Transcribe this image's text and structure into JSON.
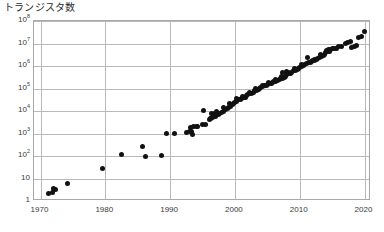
{
  "chart_data": {
    "type": "scatter",
    "title": "トランジスタ数",
    "xlabel": "",
    "ylabel": "",
    "xlim": [
      1969,
      2021
    ],
    "ylim_log10": [
      0,
      8
    ],
    "yscale": "log",
    "grid": true,
    "legend": "none",
    "marker": {
      "shape": "circle",
      "color": "#111111",
      "size_px": 5
    },
    "y_ticks": [
      {
        "value": 1,
        "label": "1",
        "mantissa": "1",
        "exponent": ""
      },
      {
        "value": 10,
        "label": "10",
        "mantissa": "10",
        "exponent": ""
      },
      {
        "value": 100,
        "label": "10^2",
        "mantissa": "10",
        "exponent": "2"
      },
      {
        "value": 1000,
        "label": "10^3",
        "mantissa": "10",
        "exponent": "3"
      },
      {
        "value": 10000,
        "label": "10^4",
        "mantissa": "10",
        "exponent": "4"
      },
      {
        "value": 100000,
        "label": "10^5",
        "mantissa": "10",
        "exponent": "5"
      },
      {
        "value": 1000000,
        "label": "10^6",
        "mantissa": "10",
        "exponent": "6"
      },
      {
        "value": 10000000,
        "label": "10^7",
        "mantissa": "10",
        "exponent": "7"
      },
      {
        "value": 100000000,
        "label": "10^8",
        "mantissa": "10",
        "exponent": "8"
      }
    ],
    "x_ticks": [
      {
        "value": 1970,
        "label": "1970"
      },
      {
        "value": 1980,
        "label": "1980"
      },
      {
        "value": 1990,
        "label": "1990"
      },
      {
        "value": 2000,
        "label": "2000"
      },
      {
        "value": 2010,
        "label": "2010"
      },
      {
        "value": 2020,
        "label": "2020"
      }
    ],
    "points": [
      [
        1971.3,
        2.2
      ],
      [
        1971.8,
        2.3
      ],
      [
        1972.0,
        3.5
      ],
      [
        1972.3,
        3.4
      ],
      [
        1974.2,
        6.0
      ],
      [
        1979.6,
        29
      ],
      [
        1982.5,
        120
      ],
      [
        1985.8,
        275
      ],
      [
        1986.2,
        100
      ],
      [
        1988.6,
        110
      ],
      [
        1989.4,
        1050
      ],
      [
        1990.6,
        1050
      ],
      [
        1992.5,
        1100
      ],
      [
        1993.0,
        1200
      ],
      [
        1993.3,
        1250
      ],
      [
        1993.5,
        900
      ],
      [
        1993.2,
        1900
      ],
      [
        1993.6,
        2000
      ],
      [
        1994.0,
        2100
      ],
      [
        1994.2,
        2050
      ],
      [
        1995.0,
        2600
      ],
      [
        1995.4,
        2500
      ],
      [
        1995.2,
        11000
      ],
      [
        1996.0,
        4200
      ],
      [
        1996.3,
        4500
      ],
      [
        1996.6,
        5200
      ],
      [
        1996.4,
        7500
      ],
      [
        1996.8,
        7800
      ],
      [
        1996.2,
        4800
      ],
      [
        1997.0,
        5500
      ],
      [
        1997.4,
        7000
      ],
      [
        1997.6,
        7600
      ],
      [
        1997.2,
        9500
      ],
      [
        1998.0,
        9000
      ],
      [
        1998.3,
        9800
      ],
      [
        1998.6,
        12000
      ],
      [
        1998.2,
        15000
      ],
      [
        1998.8,
        13000
      ],
      [
        1999.0,
        14000
      ],
      [
        1999.3,
        16000
      ],
      [
        1999.6,
        19000
      ],
      [
        1999.2,
        21000
      ],
      [
        1999.8,
        22000
      ],
      [
        2000.0,
        25000
      ],
      [
        2000.3,
        26000
      ],
      [
        2000.6,
        31000
      ],
      [
        2000.2,
        35000
      ],
      [
        2000.8,
        33000
      ],
      [
        2001.0,
        38000
      ],
      [
        2001.3,
        42000
      ],
      [
        2001.6,
        40000
      ],
      [
        2001.2,
        45000
      ],
      [
        2001.8,
        48000
      ],
      [
        2002.0,
        55000
      ],
      [
        2002.3,
        58000
      ],
      [
        2002.6,
        62000
      ],
      [
        2002.2,
        70000
      ],
      [
        2002.8,
        66000
      ],
      [
        2003.0,
        78000
      ],
      [
        2003.3,
        85000
      ],
      [
        2003.6,
        92000
      ],
      [
        2003.2,
        100000
      ],
      [
        2003.8,
        105000
      ],
      [
        2004.0,
        110000
      ],
      [
        2004.3,
        125000
      ],
      [
        2004.6,
        130000
      ],
      [
        2004.2,
        140000
      ],
      [
        2004.8,
        135000
      ],
      [
        2005.0,
        150000
      ],
      [
        2005.3,
        160000
      ],
      [
        2005.6,
        175000
      ],
      [
        2005.2,
        185000
      ],
      [
        2005.8,
        190000
      ],
      [
        2006.0,
        200000
      ],
      [
        2006.3,
        215000
      ],
      [
        2006.6,
        230000
      ],
      [
        2006.2,
        250000
      ],
      [
        2006.8,
        245000
      ],
      [
        2007.0,
        270000
      ],
      [
        2007.3,
        290000
      ],
      [
        2007.6,
        310000
      ],
      [
        2007.2,
        330000
      ],
      [
        2007.8,
        350000
      ],
      [
        2007.4,
        520000
      ],
      [
        2007.9,
        560000
      ],
      [
        2008.0,
        420000
      ],
      [
        2008.3,
        450000
      ],
      [
        2008.6,
        480000
      ],
      [
        2008.2,
        500000
      ],
      [
        2008.8,
        530000
      ],
      [
        2009.0,
        610000
      ],
      [
        2009.3,
        640000
      ],
      [
        2009.6,
        700000
      ],
      [
        2009.2,
        760000
      ],
      [
        2009.8,
        800000
      ],
      [
        2010.0,
        900000
      ],
      [
        2010.3,
        950000
      ],
      [
        2010.6,
        1050000
      ],
      [
        2010.2,
        1150000
      ],
      [
        2010.8,
        1200000
      ],
      [
        2011.0,
        1300000
      ],
      [
        2011.3,
        1400000
      ],
      [
        2011.6,
        1500000
      ],
      [
        2011.2,
        2300000
      ],
      [
        2011.8,
        1600000
      ],
      [
        2012.0,
        1700000
      ],
      [
        2012.3,
        1800000
      ],
      [
        2012.6,
        1900000
      ],
      [
        2012.2,
        2000000
      ],
      [
        2012.8,
        2100000
      ],
      [
        2013.0,
        2400000
      ],
      [
        2013.3,
        2600000
      ],
      [
        2013.6,
        3000000
      ],
      [
        2013.2,
        3200000
      ],
      [
        2013.8,
        3400000
      ],
      [
        2014.0,
        4200000
      ],
      [
        2014.3,
        4400000
      ],
      [
        2014.6,
        4600000
      ],
      [
        2014.2,
        5000000
      ],
      [
        2014.8,
        5200000
      ],
      [
        2014.5,
        5500000
      ],
      [
        2015.0,
        5800000
      ],
      [
        2015.3,
        6000000
      ],
      [
        2015.6,
        6200000
      ],
      [
        2016.0,
        7200000
      ],
      [
        2016.4,
        7600000
      ],
      [
        2017.0,
        10500000
      ],
      [
        2017.4,
        11500000
      ],
      [
        2017.8,
        12500000
      ],
      [
        2018.0,
        7000000
      ],
      [
        2018.4,
        7400000
      ],
      [
        2018.8,
        7800000
      ],
      [
        2019.0,
        19000000
      ],
      [
        2019.5,
        21000000
      ],
      [
        2020.0,
        33000000
      ]
    ]
  }
}
